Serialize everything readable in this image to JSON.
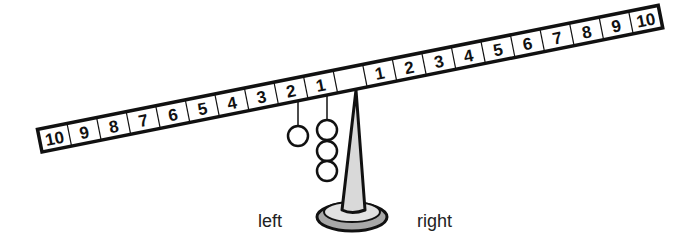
{
  "beam": {
    "left_numbers": [
      "10",
      "9",
      "8",
      "7",
      "6",
      "5",
      "4",
      "3",
      "2",
      "1"
    ],
    "center": "",
    "right_numbers": [
      "1",
      "2",
      "3",
      "4",
      "5",
      "6",
      "7",
      "8",
      "9",
      "10"
    ]
  },
  "weights": [
    {
      "side": "left",
      "position": 2,
      "count": 1
    },
    {
      "side": "left",
      "position": 1,
      "count": 3
    }
  ],
  "labels": {
    "left": "left",
    "right": "right"
  },
  "colors": {
    "stroke": "#111111",
    "pivot_fill": "#d9d9d9",
    "base_shadow": "#a8a8a8"
  }
}
